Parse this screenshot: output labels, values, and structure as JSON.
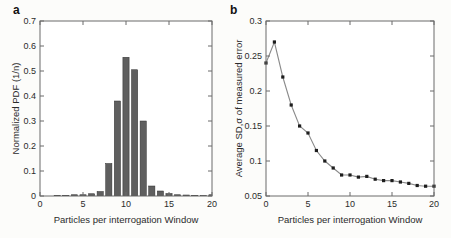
{
  "panels": [
    {
      "label": "a"
    },
    {
      "label": "b"
    }
  ],
  "colors": {
    "background": "#fcfcfa",
    "plot_background": "#ffffff",
    "axis": "#6b6b6b",
    "text": "#2b2b2b",
    "bar_fill": "#5f5f5f",
    "bar_edge": "#2f2f2f",
    "line": "#8a8a8a",
    "marker": "#1d1d1d"
  },
  "chart_data": [
    {
      "type": "bar",
      "panel": "a",
      "title": "",
      "xlabel": "Particles per interrogation Window",
      "ylabel": "Normalized PDF (1/n)",
      "xlim": [
        0,
        20
      ],
      "ylim": [
        0,
        0.7
      ],
      "xticks": [
        0,
        5,
        10,
        15,
        20
      ],
      "xticklabels": [
        "0",
        "5",
        "10",
        "15",
        "20"
      ],
      "yticks": [
        0,
        0.1,
        0.2,
        0.3,
        0.4,
        0.5,
        0.6,
        0.7
      ],
      "yticklabels": [
        "0",
        "0.1",
        "0.2",
        "0.3",
        "0.4",
        "0.5",
        "0.6",
        "0.7"
      ],
      "bar_width_units": 0.72,
      "x": [
        2,
        3,
        4,
        5,
        6,
        7,
        8,
        9,
        10,
        11,
        12,
        13,
        14,
        15,
        16,
        17,
        18,
        19,
        20
      ],
      "values": [
        0.003,
        0.003,
        0.005,
        0.005,
        0.009,
        0.018,
        0.13,
        0.38,
        0.555,
        0.505,
        0.3,
        0.04,
        0.02,
        0.01,
        0.005,
        0.004,
        0.003,
        0.002,
        0.005
      ],
      "grid": false,
      "legend": null
    },
    {
      "type": "line",
      "panel": "b",
      "title": "",
      "xlabel": "Particles per interrogation Window",
      "ylabel": "Average SD,σ of measured error",
      "xlim": [
        0,
        20
      ],
      "ylim": [
        0.05,
        0.3
      ],
      "xticks": [
        0,
        5,
        10,
        15,
        20
      ],
      "xticklabels": [
        "0",
        "5",
        "10",
        "15",
        "20"
      ],
      "yticks": [
        0.05,
        0.1,
        0.15,
        0.2,
        0.25,
        0.3
      ],
      "yticklabels": [
        "0.05",
        "0.1",
        "0.15",
        "0.2",
        "0.25",
        "0.3"
      ],
      "marker": "square",
      "x": [
        0,
        1,
        2,
        3,
        4,
        5,
        6,
        7,
        8,
        9,
        10,
        11,
        12,
        13,
        14,
        15,
        16,
        17,
        18,
        19,
        20
      ],
      "values": [
        0.24,
        0.27,
        0.22,
        0.18,
        0.15,
        0.14,
        0.115,
        0.1,
        0.09,
        0.08,
        0.08,
        0.077,
        0.078,
        0.074,
        0.072,
        0.072,
        0.07,
        0.068,
        0.065,
        0.064,
        0.064
      ],
      "grid": false,
      "legend": null
    }
  ]
}
